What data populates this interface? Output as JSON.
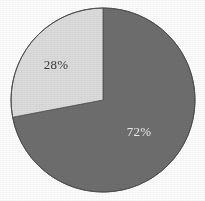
{
  "chart_data": {
    "type": "pie",
    "title": "",
    "subtitle": "",
    "xlabel": "",
    "ylabel": "",
    "grid": false,
    "legend": "none",
    "start_angle_deg": 0,
    "direction": "clockwise",
    "categories": [
      "Majority share",
      "Minority share"
    ],
    "values": [
      72,
      28
    ],
    "units": "percent",
    "slices": [
      {
        "label": "72%",
        "value": 72,
        "color": "#6e6e6e",
        "label_color": "#eeeeee",
        "label_x": 139,
        "label_y": 133,
        "start_deg": 0,
        "end_deg": 259.2
      },
      {
        "label": "28%",
        "value": 28,
        "color": "#dcdcdc",
        "label_color": "#3a3a3a",
        "label_x": 56,
        "label_y": 66,
        "start_deg": 259.2,
        "end_deg": 360
      }
    ],
    "annotations": [
      "72%",
      "28%"
    ],
    "geometry": {
      "center_x": 103,
      "center_y": 100,
      "radius": 92
    },
    "colors": {
      "background": "#fdfdfd",
      "slice_dark": "#6e6e6e",
      "slice_light": "#dcdcdc",
      "outline": "#4f4f4f",
      "label_on_dark": "#eeeeee",
      "label_on_light": "#3a3a3a"
    }
  }
}
